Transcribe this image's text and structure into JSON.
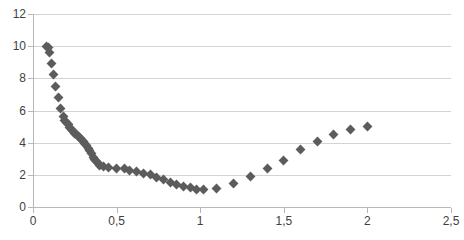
{
  "chart_data": {
    "type": "scatter",
    "title": "",
    "xlabel": "",
    "ylabel": "",
    "xlim": [
      0,
      2.5
    ],
    "ylim": [
      0,
      12
    ],
    "grid": true,
    "legend": false,
    "decimal_separator": ",",
    "marker": {
      "shape": "diamond",
      "color": "#5c5c5c",
      "size": 7
    },
    "axis": {
      "y_ticks": [
        0,
        2,
        4,
        6,
        8,
        10,
        12
      ],
      "y_tick_labels": [
        "0",
        "2",
        "4",
        "6",
        "8",
        "10",
        "12"
      ],
      "x_ticks": [
        0,
        0.5,
        1,
        1.5,
        2,
        2.5
      ],
      "x_tick_labels": [
        "0",
        "0,5",
        "1",
        "1,5",
        "2",
        "2,5"
      ],
      "gridline_color": "#d4d4d4",
      "axis_line_color": "#b8b8b8"
    },
    "series": [
      {
        "name": "series-1",
        "points": [
          [
            0.08,
            10.0
          ],
          [
            0.09,
            9.9
          ],
          [
            0.1,
            9.6
          ],
          [
            0.11,
            8.9
          ],
          [
            0.12,
            8.25
          ],
          [
            0.135,
            7.5
          ],
          [
            0.15,
            6.8
          ],
          [
            0.165,
            6.1
          ],
          [
            0.18,
            5.6
          ],
          [
            0.19,
            5.4
          ],
          [
            0.2,
            5.25
          ],
          [
            0.21,
            5.1
          ],
          [
            0.22,
            4.95
          ],
          [
            0.23,
            4.8
          ],
          [
            0.24,
            4.7
          ],
          [
            0.25,
            4.6
          ],
          [
            0.26,
            4.5
          ],
          [
            0.27,
            4.4
          ],
          [
            0.28,
            4.3
          ],
          [
            0.29,
            4.2
          ],
          [
            0.3,
            4.1
          ],
          [
            0.31,
            3.95
          ],
          [
            0.32,
            3.8
          ],
          [
            0.33,
            3.65
          ],
          [
            0.34,
            3.5
          ],
          [
            0.35,
            3.3
          ],
          [
            0.36,
            3.1
          ],
          [
            0.37,
            2.95
          ],
          [
            0.38,
            2.8
          ],
          [
            0.39,
            2.7
          ],
          [
            0.4,
            2.6
          ],
          [
            0.42,
            2.5
          ],
          [
            0.45,
            2.45
          ],
          [
            0.5,
            2.42
          ],
          [
            0.55,
            2.38
          ],
          [
            0.58,
            2.3
          ],
          [
            0.62,
            2.2
          ],
          [
            0.66,
            2.1
          ],
          [
            0.7,
            2.0
          ],
          [
            0.74,
            1.85
          ],
          [
            0.78,
            1.7
          ],
          [
            0.82,
            1.55
          ],
          [
            0.86,
            1.4
          ],
          [
            0.9,
            1.3
          ],
          [
            0.94,
            1.2
          ],
          [
            0.98,
            1.1
          ],
          [
            1.02,
            1.1
          ],
          [
            1.1,
            1.15
          ],
          [
            1.2,
            1.45
          ],
          [
            1.3,
            1.9
          ],
          [
            1.4,
            2.4
          ],
          [
            1.5,
            2.9
          ],
          [
            1.6,
            3.6
          ],
          [
            1.7,
            4.1
          ],
          [
            1.8,
            4.5
          ],
          [
            1.9,
            4.8
          ],
          [
            2.0,
            5.0
          ]
        ]
      }
    ]
  }
}
